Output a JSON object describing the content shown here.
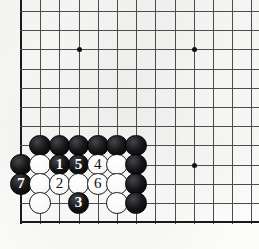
{
  "diagram": {
    "kind": "go-board-diagram",
    "board_size_shown": {
      "columns": 13,
      "rows": 12
    },
    "geometry": {
      "origin_x": 21,
      "origin_y": 11,
      "spacing": 19.2,
      "left_edge_is_board_edge": true,
      "bottom_edge_is_board_edge": true
    },
    "colors": {
      "background": "#fbfbfa",
      "grid_line": "#4c4c4c",
      "board_edge": "#1a1a1a",
      "black_stone": "#111111",
      "white_stone": "#ffffff",
      "star_point": "#111111",
      "black_label_text": "#ffffff",
      "white_label_text": "#111111"
    },
    "star_points": [
      {
        "name": "star-point-upper-left",
        "col": 4,
        "row": 3
      },
      {
        "name": "star-point-upper-right",
        "col": 10,
        "row": 3
      },
      {
        "name": "star-point-lower-right",
        "col": 10,
        "row": 9
      }
    ],
    "stones": [
      {
        "id": "b-c2r8",
        "color": "black",
        "col": 2,
        "row": 8,
        "label": ""
      },
      {
        "id": "b-c3r8",
        "color": "black",
        "col": 3,
        "row": 8,
        "label": ""
      },
      {
        "id": "b-c4r8",
        "color": "black",
        "col": 4,
        "row": 8,
        "label": ""
      },
      {
        "id": "b-c5r8",
        "color": "black",
        "col": 5,
        "row": 8,
        "label": ""
      },
      {
        "id": "b-c6r8",
        "color": "black",
        "col": 6,
        "row": 8,
        "label": ""
      },
      {
        "id": "b-c7r8",
        "color": "black",
        "col": 7,
        "row": 8,
        "label": ""
      },
      {
        "id": "b-c1r9",
        "color": "black",
        "col": 1,
        "row": 9,
        "label": ""
      },
      {
        "id": "w-c2r9",
        "color": "white",
        "col": 2,
        "row": 9,
        "label": ""
      },
      {
        "id": "b-c3r9",
        "color": "black",
        "col": 3,
        "row": 9,
        "label": "1"
      },
      {
        "id": "b-c4r9",
        "color": "black",
        "col": 4,
        "row": 9,
        "label": "5"
      },
      {
        "id": "w-c5r9",
        "color": "white",
        "col": 5,
        "row": 9,
        "label": "4"
      },
      {
        "id": "w-c6r9",
        "color": "white",
        "col": 6,
        "row": 9,
        "label": ""
      },
      {
        "id": "b-c7r9",
        "color": "black",
        "col": 7,
        "row": 9,
        "label": ""
      },
      {
        "id": "b-c1r10",
        "color": "black",
        "col": 1,
        "row": 10,
        "label": "7"
      },
      {
        "id": "w-c2r10",
        "color": "white",
        "col": 2,
        "row": 10,
        "label": ""
      },
      {
        "id": "w-c3r10",
        "color": "white",
        "col": 3,
        "row": 10,
        "label": "2"
      },
      {
        "id": "w-c4r10",
        "color": "white",
        "col": 4,
        "row": 10,
        "label": ""
      },
      {
        "id": "w-c5r10",
        "color": "white",
        "col": 5,
        "row": 10,
        "label": "6"
      },
      {
        "id": "w-c6r10",
        "color": "white",
        "col": 6,
        "row": 10,
        "label": ""
      },
      {
        "id": "b-c7r10",
        "color": "black",
        "col": 7,
        "row": 10,
        "label": ""
      },
      {
        "id": "w-c2r11",
        "color": "white",
        "col": 2,
        "row": 11,
        "label": ""
      },
      {
        "id": "b-c4r11",
        "color": "black",
        "col": 4,
        "row": 11,
        "label": "3"
      },
      {
        "id": "w-c6r11",
        "color": "white",
        "col": 6,
        "row": 11,
        "label": ""
      },
      {
        "id": "b-c7r11",
        "color": "black",
        "col": 7,
        "row": 11,
        "label": ""
      }
    ],
    "move_sequence": [
      {
        "number": "1",
        "color": "black"
      },
      {
        "number": "2",
        "color": "white"
      },
      {
        "number": "3",
        "color": "black"
      },
      {
        "number": "4",
        "color": "white"
      },
      {
        "number": "5",
        "color": "black"
      },
      {
        "number": "6",
        "color": "white"
      },
      {
        "number": "7",
        "color": "black"
      }
    ]
  }
}
